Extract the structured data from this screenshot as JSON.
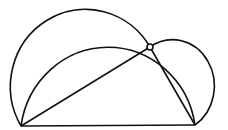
{
  "diagram": {
    "type": "geometry",
    "stroke_color": "#111111",
    "background": "#ffffff",
    "points": {
      "A": [
        21,
        126
      ],
      "B": [
        195,
        125
      ],
      "P": [
        150,
        47
      ]
    },
    "segments": [
      {
        "from": "A",
        "to": "B"
      },
      {
        "from": "A",
        "to": "P"
      },
      {
        "from": "P",
        "to": "B"
      }
    ],
    "arcs": [
      {
        "name": "outer-arc",
        "through": [
          "A",
          "P"
        ]
      },
      {
        "name": "inner-arc",
        "through": [
          "A",
          "P",
          "B"
        ]
      },
      {
        "name": "right-circle",
        "through": [
          "P",
          "B"
        ]
      }
    ],
    "marker": {
      "at": "P",
      "shape": "small-circle"
    }
  }
}
